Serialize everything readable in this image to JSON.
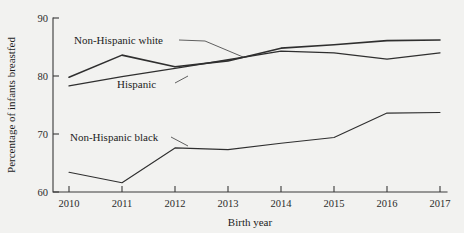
{
  "figure": {
    "background_color": "#f2f2f0",
    "line_color": "#2f2f2f"
  },
  "chart_data": {
    "type": "line",
    "title": "",
    "xlabel": "Birth year",
    "ylabel": "Percentage of infants breastfed",
    "x": [
      2010,
      2011,
      2012,
      2013,
      2014,
      2015,
      2016,
      2017
    ],
    "xtick_labels": [
      "2010",
      "2011",
      "2012",
      "2013",
      "2014",
      "2015",
      "2016",
      "2017"
    ],
    "ytick_labels": [
      "60",
      "70",
      "80",
      "90"
    ],
    "yticks": [
      60,
      70,
      80,
      90
    ],
    "xlim": [
      2010,
      2017
    ],
    "ylim": [
      60,
      90
    ],
    "grid": false,
    "legend_position": "inline-annotations",
    "series": [
      {
        "name": "Non-Hispanic white",
        "values": [
          79.8,
          83.6,
          81.6,
          82.6,
          84.8,
          85.4,
          86.1,
          86.2
        ]
      },
      {
        "name": "Hispanic",
        "values": [
          78.3,
          79.9,
          81.3,
          82.8,
          84.3,
          84.0,
          82.9,
          84.0
        ]
      },
      {
        "name": "Non-Hispanic black",
        "values": [
          63.4,
          61.6,
          67.6,
          67.3,
          68.4,
          69.4,
          73.6,
          73.7
        ]
      }
    ],
    "annotations": [
      {
        "text": "Non-Hispanic white",
        "series": "Non-Hispanic white"
      },
      {
        "text": "Hispanic",
        "series": "Hispanic"
      },
      {
        "text": "Non-Hispanic black",
        "series": "Non-Hispanic black"
      }
    ]
  }
}
